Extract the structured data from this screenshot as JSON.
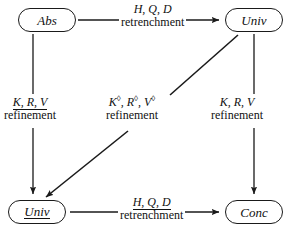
{
  "diagram": {
    "nodes": [
      {
        "id": "abs",
        "label": "Abs",
        "underlined": false
      },
      {
        "id": "univ_tr",
        "label": "Univ",
        "underlined": false
      },
      {
        "id": "univ_bl",
        "label": "Univ",
        "underlined": true
      },
      {
        "id": "conc",
        "label": "Conc",
        "underlined": false
      }
    ],
    "edges": [
      {
        "id": "top",
        "from": "abs",
        "to": "univ_tr",
        "direction": "right",
        "symbols": "H, Q, D",
        "symbols_underlined": false,
        "word": "retrenchment"
      },
      {
        "id": "left",
        "from": "abs",
        "to": "univ_bl",
        "direction": "down",
        "symbols": "K, R, V",
        "symbols_underlined": true,
        "word": "refinement"
      },
      {
        "id": "diagonal",
        "from": "univ_tr",
        "to": "univ_bl",
        "direction": "down-left",
        "symbols": "K◊, R◊, V◊",
        "symbols_underlined": false,
        "word": "refinement",
        "superscript": "◊"
      },
      {
        "id": "right",
        "from": "univ_tr",
        "to": "conc",
        "direction": "down",
        "symbols": "K, R, V",
        "symbols_underlined": false,
        "word": "refinement"
      },
      {
        "id": "bottom",
        "from": "univ_bl",
        "to": "conc",
        "direction": "right",
        "symbols": "H, Q, D",
        "symbols_underlined": true,
        "word": "retrenchment"
      }
    ],
    "colors": {
      "stroke": "#1a1a1a",
      "text": "#111111",
      "background": "#ffffff"
    }
  }
}
